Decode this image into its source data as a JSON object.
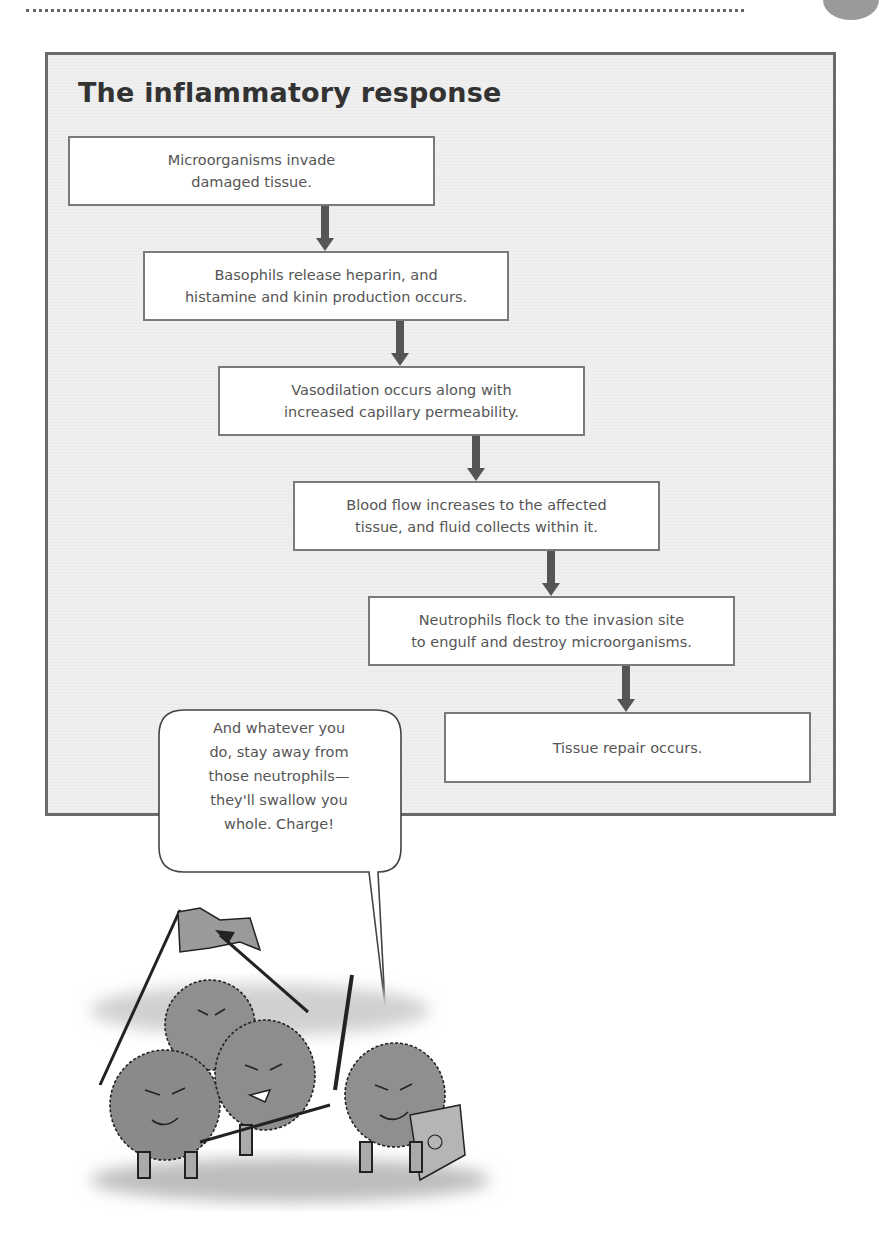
{
  "header": {
    "dotted_rule": true,
    "tab_marker_color": "#9a9a9a"
  },
  "diagram": {
    "title": "The inflammatory response",
    "frame_color": "#6a6a6a",
    "background_color": "#efefef",
    "steps": [
      {
        "text": "Microorganisms invade\ndamaged tissue."
      },
      {
        "text": "Basophils release heparin, and\nhistamine and kinin production occurs."
      },
      {
        "text": "Vasodilation occurs along with\nincreased capillary permeability."
      },
      {
        "text": "Blood flow increases to the affected\ntissue, and fluid collects within it."
      },
      {
        "text": "Neutrophils flock to the invasion site\nto engulf and destroy microorganisms."
      },
      {
        "text": "Tissue repair occurs."
      }
    ],
    "arrow_color": "#555555"
  },
  "speech_bubble": {
    "text": "And whatever you\ndo, stay away from\nthose neutrophils—\nthey'll swallow you\nwhole. Charge!"
  },
  "illustration": {
    "description": "Cartoon of four fuzzy gray microorganisms carrying spears, a flag, a sword and a shield, charging forward"
  }
}
